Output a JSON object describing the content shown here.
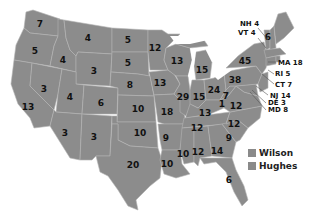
{
  "map": {
    "title": "1916 United States presidential election electoral map",
    "state_color": "#8c8c8c",
    "border_color": "#b4b4b4"
  },
  "labels": {
    "WA": "7",
    "OR": "5",
    "CA": "13",
    "ID": "4",
    "NV": "3",
    "MT": "4",
    "WY": "3",
    "UT": "4",
    "AZ": "3",
    "CO": "6",
    "NM": "3",
    "ND": "5",
    "SD": "5",
    "NE": "8",
    "KS": "10",
    "OK": "10",
    "TX": "20",
    "MN": "12",
    "IA": "13",
    "MO": "18",
    "AR": "9",
    "LA": "10",
    "WI": "13",
    "IL": "29",
    "MI": "15",
    "IN": "15",
    "OH": "24",
    "KY": "13",
    "TN": "12",
    "MS": "10",
    "AL": "12",
    "GA": "14",
    "FL": "6",
    "SC": "9",
    "NC": "12",
    "VA": "12",
    "WV": "7",
    "PA": "38",
    "NY": "45",
    "ME": "6",
    "MD_inline": "1"
  },
  "callouts": {
    "NH": "NH 4",
    "VT": "VT 4",
    "MA": "MA 18",
    "RI": "RI 5",
    "CT": "CT 7",
    "NJ": "NJ 14",
    "DE": "DE 3",
    "MD": "MD 8"
  },
  "legend": {
    "items": [
      {
        "label": "Wilson",
        "color": "#8a8a8a"
      },
      {
        "label": "Hughes",
        "color": "#8a8a8a"
      }
    ]
  }
}
